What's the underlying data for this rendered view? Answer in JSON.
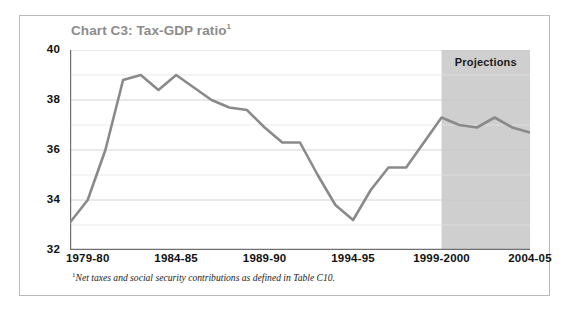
{
  "figure": {
    "title": "Chart C3: Tax-GDP ratio",
    "title_superscript": "1",
    "footnote_marker": "1",
    "footnote": "Net taxes and social security contributions as defined in Table C10.",
    "projections_label": "Projections",
    "colors": {
      "line": "#8a8a8a",
      "projection_band": "#cfcfcf",
      "frame": "#b9b9b9",
      "title": "#8b8b8b",
      "axis": "#6f6f6f",
      "gridline": "#d8d8d8",
      "tick_label": "#111111",
      "background": "#ffffff"
    }
  },
  "chart_data": {
    "type": "line",
    "title": "Chart C3: Tax-GDP ratio",
    "xlabel": "",
    "ylabel": "",
    "ylim": [
      32,
      40
    ],
    "yticks": [
      32,
      34,
      36,
      38,
      40
    ],
    "yticks_minor": [
      33,
      35,
      37,
      39
    ],
    "ytick_labels": [
      "32",
      "34",
      "36",
      "38",
      "40"
    ],
    "grid": true,
    "legend": false,
    "x_tick_labels": [
      "1979-80",
      "1984-85",
      "1989-90",
      "1994-95",
      "1999-2000",
      "2004-05"
    ],
    "x_tick_categories": [
      "1979-80",
      "1984-85",
      "1989-90",
      "1994-95",
      "1999-2000",
      "2004-05"
    ],
    "categories": [
      "1978-79",
      "1979-80",
      "1980-81",
      "1981-82",
      "1982-83",
      "1983-84",
      "1984-85",
      "1985-86",
      "1986-87",
      "1987-88",
      "1988-89",
      "1989-90",
      "1990-91",
      "1991-92",
      "1992-93",
      "1993-94",
      "1994-95",
      "1995-96",
      "1996-97",
      "1997-98",
      "1998-99",
      "1999-2000",
      "2000-01",
      "2001-02",
      "2002-03",
      "2003-04",
      "2004-05"
    ],
    "values": [
      33.1,
      34.0,
      36.0,
      38.8,
      39.0,
      38.4,
      39.0,
      38.5,
      38.0,
      37.7,
      37.6,
      36.9,
      36.3,
      36.3,
      35.0,
      33.8,
      33.2,
      34.4,
      35.3,
      35.3,
      36.3,
      37.3,
      37.0,
      36.9,
      37.3,
      36.9,
      36.7
    ],
    "annotations": [
      {
        "text": "Projections",
        "type": "shaded-region-label",
        "region_start": "1999-2000",
        "region_end": "2004-05"
      }
    ],
    "notes": "Net taxes and social security contributions as defined in Table C10."
  }
}
